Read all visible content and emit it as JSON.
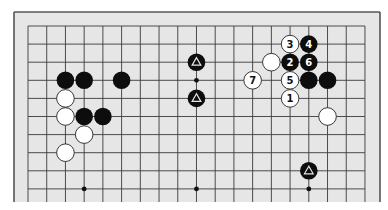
{
  "diagram": {
    "type": "go-board-partial",
    "board_color": "#e6e6e6",
    "line_color": "#3a3a3a",
    "frame_color": "#555555",
    "grid": {
      "columns": 19,
      "rows": 10,
      "x0": 28,
      "y0": 26,
      "dx": 18.72,
      "dy": 18.1
    },
    "frame": {
      "left": 14,
      "top": 12,
      "right": 380,
      "bottom": 202
    },
    "hoshi": [
      {
        "col": 9,
        "row": 3
      },
      {
        "col": 3,
        "row": 9
      },
      {
        "col": 9,
        "row": 9
      },
      {
        "col": 15,
        "row": 9
      }
    ],
    "stones": [
      {
        "color": "black",
        "col": 2,
        "row": 3,
        "label": ""
      },
      {
        "color": "black",
        "col": 3,
        "row": 3,
        "label": ""
      },
      {
        "color": "black",
        "col": 5,
        "row": 3,
        "label": ""
      },
      {
        "color": "white",
        "col": 2,
        "row": 4,
        "label": ""
      },
      {
        "color": "white",
        "col": 2,
        "row": 5,
        "label": ""
      },
      {
        "color": "black",
        "col": 3,
        "row": 5,
        "label": ""
      },
      {
        "color": "black",
        "col": 4,
        "row": 5,
        "label": ""
      },
      {
        "color": "white",
        "col": 3,
        "row": 6,
        "label": ""
      },
      {
        "color": "white",
        "col": 2,
        "row": 7,
        "label": ""
      },
      {
        "color": "black",
        "col": 9,
        "row": 2,
        "label": "",
        "marker": "triangle"
      },
      {
        "color": "black",
        "col": 9,
        "row": 4,
        "label": "",
        "marker": "triangle"
      },
      {
        "color": "black",
        "col": 15,
        "row": 8,
        "label": "",
        "marker": "triangle"
      },
      {
        "color": "white",
        "col": 14,
        "row": 1,
        "label": "3"
      },
      {
        "color": "black",
        "col": 15,
        "row": 1,
        "label": "4"
      },
      {
        "color": "white",
        "col": 13,
        "row": 2,
        "label": ""
      },
      {
        "color": "black",
        "col": 14,
        "row": 2,
        "label": "2"
      },
      {
        "color": "black",
        "col": 15,
        "row": 2,
        "label": "6"
      },
      {
        "color": "white",
        "col": 12,
        "row": 3,
        "label": "7"
      },
      {
        "color": "white",
        "col": 14,
        "row": 3,
        "label": "5"
      },
      {
        "color": "black",
        "col": 15,
        "row": 3,
        "label": ""
      },
      {
        "color": "black",
        "col": 16,
        "row": 3,
        "label": ""
      },
      {
        "color": "white",
        "col": 14,
        "row": 4,
        "label": "1"
      },
      {
        "color": "white",
        "col": 16,
        "row": 5,
        "label": ""
      }
    ]
  }
}
